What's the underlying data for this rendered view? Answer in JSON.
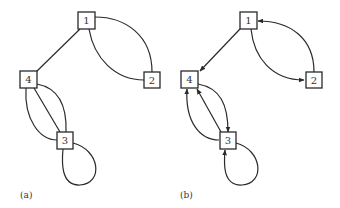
{
  "figure": {
    "panels": [
      {
        "id": "a",
        "label": "(a)",
        "directed": false,
        "nodes": [
          "1",
          "2",
          "3",
          "4"
        ],
        "edges": [
          {
            "from": "1",
            "to": "4"
          },
          {
            "from": "1",
            "to": "2"
          },
          {
            "from": "1",
            "to": "2"
          },
          {
            "from": "4",
            "to": "3"
          },
          {
            "from": "4",
            "to": "3"
          },
          {
            "from": "4",
            "to": "3"
          },
          {
            "from": "3",
            "to": "3"
          }
        ]
      },
      {
        "id": "b",
        "label": "(b)",
        "directed": true,
        "nodes": [
          "1",
          "2",
          "3",
          "4"
        ],
        "edges": [
          {
            "from": "1",
            "to": "4"
          },
          {
            "from": "1",
            "to": "2"
          },
          {
            "from": "2",
            "to": "1"
          },
          {
            "from": "4",
            "to": "3"
          },
          {
            "from": "3",
            "to": "4"
          },
          {
            "from": "3",
            "to": "4"
          },
          {
            "from": "3",
            "to": "3"
          }
        ]
      }
    ]
  },
  "colors": {
    "stroke": "#2a2a2a",
    "text": "#333333",
    "background": "#ffffff"
  }
}
